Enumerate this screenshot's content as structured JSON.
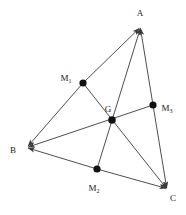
{
  "figure": {
    "kind": "geometry-diagram",
    "background_color": "#ffffff",
    "line_color": "#3a3a3a",
    "point_color": "#111111",
    "label_color": "#1a1a1a",
    "width": 186,
    "height": 215
  },
  "points": {
    "A": {
      "label": "A",
      "x": 140,
      "y": 27,
      "label_x": 140,
      "label_y": 13,
      "marker": "none"
    },
    "B": {
      "label": "B",
      "x": 27,
      "y": 147,
      "label_x": 13,
      "label_y": 150,
      "marker": "none"
    },
    "C": {
      "label": "C",
      "x": 167,
      "y": 189,
      "label_x": 173,
      "label_y": 198,
      "marker": "none"
    },
    "M1": {
      "label": "M",
      "sub": "1",
      "x": 83,
      "y": 83,
      "label_x": 66,
      "label_y": 78,
      "marker": "dot"
    },
    "M2": {
      "label": "M",
      "sub": "2",
      "x": 97,
      "y": 169,
      "label_x": 91,
      "label_y": 188,
      "marker": "dot"
    },
    "M3": {
      "label": "M",
      "sub": "3",
      "x": 153,
      "y": 105,
      "label_x": 162,
      "label_y": 108,
      "marker": "dot"
    },
    "G": {
      "label": "G",
      "x": 112,
      "y": 120,
      "label_x": 107,
      "label_y": 109,
      "marker": "dot"
    }
  },
  "segments": [
    {
      "name": "side-AB",
      "from": "B",
      "to": "A",
      "arrow_at": "both",
      "via": "M1"
    },
    {
      "name": "side-BC",
      "from": "B",
      "to": "C",
      "arrow_at": "both",
      "via": "M2"
    },
    {
      "name": "side-AC",
      "from": "A",
      "to": "C",
      "arrow_at": "both",
      "via": "M3"
    },
    {
      "name": "median-A-M2",
      "from": "A",
      "to": "M2",
      "arrow_at": "start",
      "via": "G"
    },
    {
      "name": "median-B-M3",
      "from": "B",
      "to": "M3",
      "arrow_at": "start",
      "via": "G"
    },
    {
      "name": "median-C-M1",
      "from": "C",
      "to": "M1",
      "arrow_at": "start",
      "via": "G"
    }
  ]
}
